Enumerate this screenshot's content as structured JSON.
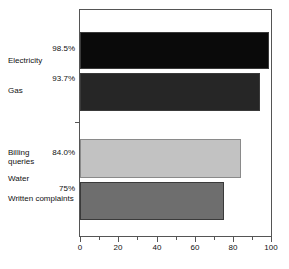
{
  "chart_data": {
    "type": "bar",
    "orientation": "horizontal",
    "title": "",
    "xlabel": "",
    "ylabel": "",
    "xlim": [
      0,
      100
    ],
    "grid": false,
    "legend": "none",
    "xticks": [
      0,
      20,
      40,
      60,
      80,
      100
    ],
    "xticklabels": [
      "0",
      "20",
      "40",
      "60",
      "80",
      "100"
    ],
    "xminorticks": [
      10,
      30,
      50,
      70,
      90
    ],
    "categories": [
      "Electricity",
      "Gas",
      "Billing\nqueries",
      "Water",
      "Written complaints"
    ],
    "values": [
      98.5,
      93.7,
      84.0,
      null,
      75
    ],
    "value_labels": [
      "98.5%",
      "93.7%",
      "84.0%",
      "",
      "75%"
    ],
    "bar_colors": [
      "#0a0a0a",
      "#262626",
      "#c2c2c2",
      "",
      "#6e6e6e"
    ],
    "bars": [
      {
        "category": "Electricity",
        "value": 98.5,
        "label": "98.5%",
        "color": "#0a0a0a"
      },
      {
        "category": "Gas",
        "value": 93.7,
        "label": "93.7%",
        "color": "#262626"
      },
      {
        "category": "Billing queries",
        "value": 84.0,
        "label": "84.0%",
        "color": "#c2c2c2"
      },
      {
        "category": "Written complaints",
        "value": 75,
        "label": "75%",
        "color": "#6e6e6e"
      }
    ]
  },
  "axis": {
    "tick_0": "0",
    "tick_20": "20",
    "tick_40": "40",
    "tick_60": "60",
    "tick_80": "80",
    "tick_100": "100"
  },
  "categories": {
    "electricity": "Electricity",
    "gas": "Gas",
    "billing_queries": "Billing\nqueries",
    "water": "Water",
    "written_complaints": "Written complaints"
  },
  "values": {
    "electricity": "98.5%",
    "gas": "93.7%",
    "billing_queries": "84.0%",
    "written_complaints": "75%"
  },
  "colors": {
    "bar_electricity": "#0a0a0a",
    "bar_gas": "#262626",
    "bar_billing": "#c2c2c2",
    "bar_written": "#6e6e6e",
    "frame": "#555555",
    "background": "#ffffff"
  }
}
